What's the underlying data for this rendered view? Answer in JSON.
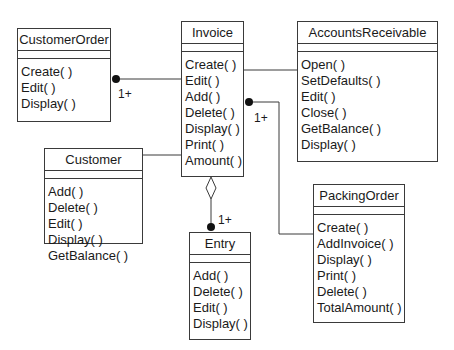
{
  "diagram": {
    "type": "UML class diagram",
    "classes": {
      "customer_order": {
        "name": "CustomerOrder",
        "operations": [
          "Create( )",
          "Edit( )",
          "Display( )"
        ]
      },
      "invoice": {
        "name": "Invoice",
        "operations": [
          "Create( )",
          "Edit( )",
          "Add( )",
          "Delete( )",
          "Display( )",
          "Print( )",
          "Amount( )"
        ]
      },
      "accounts_receivable": {
        "name": "AccountsReceivable",
        "operations": [
          "Open( )",
          "SetDefaults( )",
          "Edit( )",
          "Close( )",
          "GetBalance( )",
          "Display( )"
        ]
      },
      "customer": {
        "name": "Customer",
        "operations": [
          "Add( )",
          "Delete( )",
          "Edit( )",
          "Display( )",
          "GetBalance( )"
        ]
      },
      "entry": {
        "name": "Entry",
        "operations": [
          "Add( )",
          "Delete( )",
          "Edit( )",
          "Display( )"
        ]
      },
      "packing_order": {
        "name": "PackingOrder",
        "operations": [
          "Create( )",
          "AddInvoice( )",
          "Display( )",
          "Print( )",
          "Delete( )",
          "TotalAmount( )"
        ]
      }
    },
    "relationships": [
      {
        "from": "Invoice",
        "to": "CustomerOrder",
        "kind": "association",
        "end_marker": "filled-dot",
        "multiplicity": "1+"
      },
      {
        "from": "Invoice",
        "to": "AccountsReceivable",
        "kind": "association",
        "multiplicity": ""
      },
      {
        "from": "Invoice",
        "to": "Customer",
        "kind": "association",
        "multiplicity": ""
      },
      {
        "from": "Invoice",
        "to": "Entry",
        "kind": "aggregation",
        "end_marker": "filled-dot",
        "multiplicity": "1+"
      },
      {
        "from": "PackingOrder",
        "to": "Invoice",
        "kind": "association",
        "end_marker": "filled-dot",
        "multiplicity": "1+"
      }
    ],
    "multiplicity_labels": {
      "customer_order": "1+",
      "invoice_side": "1+",
      "entry": "1+"
    },
    "colors": {
      "line": "#3a3a3a",
      "text": "#1a1a1a",
      "background": "#ffffff"
    }
  }
}
